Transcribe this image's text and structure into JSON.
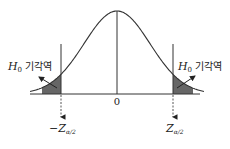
{
  "diagram": {
    "title": "",
    "distribution": "standard normal",
    "center_label": "0",
    "left_critical_label": {
      "prefix": "−Z",
      "subscript": "α/2"
    },
    "right_critical_label": {
      "prefix": "Z",
      "subscript": "α/2"
    },
    "rejection_region_label": {
      "symbol": "H",
      "subscript": "0",
      "text": " 기각역"
    },
    "colors": {
      "curve": "#333333",
      "shade": "#666666",
      "axis": "#333333"
    }
  }
}
